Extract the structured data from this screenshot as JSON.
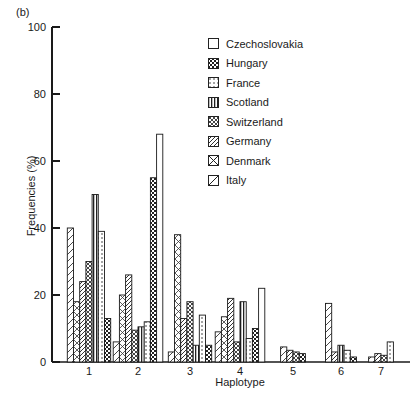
{
  "panel_label": "(b)",
  "chart_data": {
    "type": "bar",
    "title": "",
    "xlabel": "Haplotype",
    "ylabel": "Frequencies (%)",
    "ylim": [
      0,
      100
    ],
    "yticks": [
      0,
      20,
      40,
      60,
      80,
      100
    ],
    "grid": false,
    "legend_position": "upper right",
    "categories": [
      "1",
      "2",
      "3",
      "4",
      "5",
      "6",
      "7"
    ],
    "series": [
      {
        "name": "Czechoslovakia",
        "pattern": "empty",
        "values": [
          0,
          68,
          0,
          22,
          0,
          0,
          0
        ]
      },
      {
        "name": "Hungary",
        "pattern": "dense-dots",
        "values": [
          13,
          55,
          5,
          10,
          2.5,
          1.5,
          0
        ]
      },
      {
        "name": "France",
        "pattern": "light-dots",
        "values": [
          39,
          12,
          14,
          7,
          0,
          3.5,
          6
        ]
      },
      {
        "name": "Scotland",
        "pattern": "vertical-lines",
        "values": [
          50,
          10.5,
          5,
          18,
          0,
          5,
          0
        ]
      },
      {
        "name": "Switzerland",
        "pattern": "crosshatch",
        "values": [
          30,
          9.5,
          18,
          6,
          3,
          0,
          2
        ]
      },
      {
        "name": "Germany",
        "pattern": "diagonal-hatch",
        "values": [
          24,
          26,
          13,
          19,
          3.5,
          3,
          2.5
        ]
      },
      {
        "name": "Denmark",
        "pattern": "box-x",
        "values": [
          18,
          20,
          38,
          13.5,
          0,
          0,
          0
        ]
      },
      {
        "name": "Italy",
        "pattern": "single-diagonal",
        "values": [
          40,
          6,
          3,
          9,
          4.5,
          17.5,
          1.5
        ]
      }
    ]
  },
  "legend": {
    "items": [
      "Czechoslovakia",
      "Hungary",
      "France",
      "Scotland",
      "Switzerland",
      "Germany",
      "Denmark",
      "Italy"
    ]
  }
}
